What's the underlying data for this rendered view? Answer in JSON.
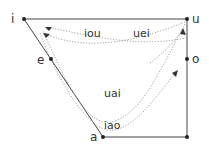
{
  "diagram": {
    "type": "vowel-trapezoid-diphthong-triphthong",
    "vertices": [
      {
        "label": "i",
        "x": 24,
        "y": 19,
        "lx": 13,
        "ly": 23
      },
      {
        "label": "u",
        "x": 187,
        "y": 19,
        "lx": 192,
        "ly": 23
      },
      {
        "label": "e",
        "x": 51,
        "y": 59,
        "lx": 39,
        "ly": 64
      },
      {
        "label": "o",
        "x": 187,
        "y": 59,
        "lx": 192,
        "ly": 63
      },
      {
        "label": "a",
        "x": 103,
        "y": 137,
        "lx": 90,
        "ly": 141
      }
    ],
    "corner": {
      "x": 187,
      "y": 137
    },
    "paths": [
      {
        "label": "iou",
        "lx": 84,
        "ly": 37
      },
      {
        "label": "uei",
        "lx": 133,
        "ly": 37
      },
      {
        "label": "uai",
        "lx": 103,
        "ly": 97
      },
      {
        "label": "iao",
        "lx": 103,
        "ly": 129
      }
    ],
    "colors": {
      "line": "#333333",
      "dotted": "#9a9a9a",
      "text": "#333333"
    }
  }
}
